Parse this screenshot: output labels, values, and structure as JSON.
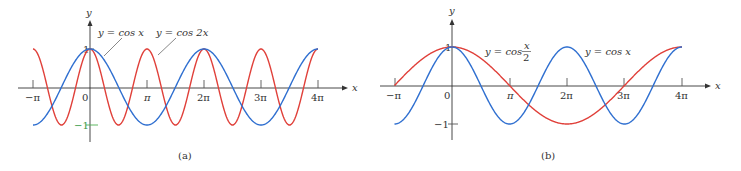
{
  "chart_data": [
    {
      "type": "line",
      "panel": "(a)",
      "xlabel": "x",
      "ylabel": "y",
      "x_ticks": [
        "−π",
        "0",
        "π",
        "2π",
        "3π",
        "4π"
      ],
      "y_ticks": [
        "1",
        "−1"
      ],
      "xlim": [
        "-π",
        "4π"
      ],
      "ylim": [
        -1,
        1
      ],
      "grid": false,
      "series": [
        {
          "name": "y = cos x",
          "function": "cos(x)",
          "color": "#2f6fd0",
          "x": [
            "-π",
            "-π/2",
            "0",
            "π/2",
            "π",
            "3π/2",
            "2π",
            "5π/2",
            "3π",
            "7π/2",
            "4π"
          ],
          "values": [
            -1,
            0,
            1,
            0,
            -1,
            0,
            1,
            0,
            -1,
            0,
            1
          ]
        },
        {
          "name": "y = cos 2x",
          "function": "cos(2x)",
          "color": "#e0403a",
          "x": [
            "-π",
            "-3π/4",
            "-π/2",
            "-π/4",
            "0",
            "π/4",
            "π/2",
            "3π/4",
            "π",
            "5π/4",
            "3π/2",
            "7π/4",
            "2π",
            "9π/4",
            "5π/2",
            "11π/4",
            "3π",
            "13π/4",
            "7π/2",
            "15π/4",
            "4π"
          ],
          "values": [
            1,
            0,
            -1,
            0,
            1,
            0,
            -1,
            0,
            1,
            0,
            -1,
            0,
            1,
            0,
            -1,
            0,
            1,
            0,
            -1,
            0,
            1
          ]
        }
      ],
      "annotations": [
        "y = cos x",
        "y = cos 2x"
      ]
    },
    {
      "type": "line",
      "panel": "(b)",
      "xlabel": "x",
      "ylabel": "y",
      "x_ticks": [
        "−π",
        "0",
        "π",
        "2π",
        "3π",
        "4π"
      ],
      "y_ticks": [
        "1",
        "−1"
      ],
      "xlim": [
        "-π",
        "4π"
      ],
      "ylim": [
        -1,
        1
      ],
      "grid": false,
      "series": [
        {
          "name": "y = cos x/2",
          "function": "cos(x/2)",
          "color": "#e0403a",
          "x": [
            "-π",
            "0",
            "π",
            "2π",
            "3π",
            "4π"
          ],
          "values": [
            0,
            1,
            0,
            -1,
            0,
            1
          ]
        },
        {
          "name": "y = cos x",
          "function": "cos(x)",
          "color": "#2f6fd0",
          "x": [
            "-π",
            "-π/2",
            "0",
            "π/2",
            "π",
            "3π/2",
            "2π",
            "5π/2",
            "3π",
            "7π/2",
            "4π"
          ],
          "values": [
            -1,
            0,
            1,
            0,
            -1,
            0,
            1,
            0,
            -1,
            0,
            1
          ]
        }
      ],
      "annotations": [
        "y = cos x/2",
        "y = cos x"
      ]
    }
  ],
  "panels": {
    "a": {
      "caption": "(a)",
      "x_axis_label": "x",
      "y_axis_label": "y",
      "ticks": [
        "−π",
        "0",
        "π",
        "2π",
        "3π",
        "4π"
      ],
      "y_one": "1",
      "y_neg_one": "−1",
      "label_cosx": "y = cos x",
      "label_cos2x": "y = cos 2x"
    },
    "b": {
      "caption": "(b)",
      "x_axis_label": "x",
      "y_axis_label": "y",
      "ticks": [
        "−π",
        "0",
        "π",
        "2π",
        "3π",
        "4π"
      ],
      "y_one": "1",
      "y_neg_one": "−1",
      "label_cosx2_prefix": "y = cos",
      "label_cosx2_num": "x",
      "label_cosx2_den": "2",
      "label_cosx": "y = cos x"
    }
  },
  "colors": {
    "blue": "#2f6fd0",
    "red": "#e0403a",
    "axis": "#333333"
  }
}
